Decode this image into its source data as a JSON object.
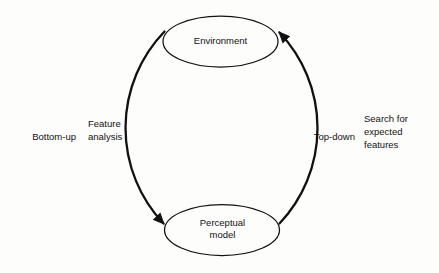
{
  "figure": {
    "type": "cycle-diagram",
    "background_color": "#fdfdfc",
    "stroke_color": "#111111",
    "nodes": [
      {
        "id": "environment",
        "label": "Environment"
      },
      {
        "id": "perceptual-model",
        "label": "Perceptual\nmodel"
      }
    ],
    "edges": [
      {
        "id": "left-arc",
        "from": "environment",
        "to": "perceptual-model",
        "direction": "downward",
        "arrowhead": "at-perceptual-model",
        "outer_label": "Bottom-up",
        "inner_label": "Feature\nanalysis"
      },
      {
        "id": "right-arc",
        "from": "perceptual-model",
        "to": "environment",
        "direction": "upward",
        "arrowhead": "at-environment",
        "inner_label": "Top-down",
        "outer_label": "Search for\nexpected\nfeatures"
      }
    ]
  }
}
